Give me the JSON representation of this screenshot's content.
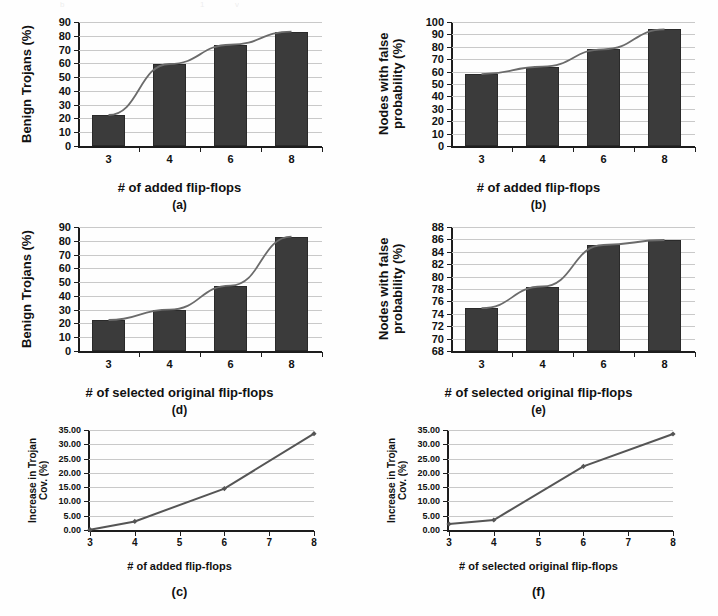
{
  "figure": {
    "background": "#ffffff",
    "bar_color": "#3b3b3b",
    "line_color": "#6b6b6b",
    "grid_color": "#c9c9c9",
    "axis_color": "#1d1d1d"
  },
  "panels": [
    {
      "caption": "(a)",
      "ylabel_lines": [
        "Benign Trojans (%)"
      ],
      "xlabel": "# of added flip-flops",
      "chart": {
        "type": "bar",
        "title": "",
        "xlabel": "# of added flip-flops",
        "ylabel": "Benign Trojans (%)",
        "categories": [
          "3",
          "4",
          "6",
          "8"
        ],
        "values": [
          22.5,
          59.5,
          73.5,
          83.0
        ],
        "yticks": [
          0,
          10,
          20,
          30,
          40,
          50,
          60,
          70,
          80,
          90
        ],
        "ylim": [
          0,
          90
        ],
        "grid": true,
        "trendline": true,
        "series": [
          {
            "name": "Benign Trojans",
            "values": [
              22.5,
              59.5,
              73.5,
              83.0
            ]
          }
        ]
      }
    },
    {
      "caption": "(b)",
      "ylabel_lines": [
        "Nodes with false",
        "probability (%)"
      ],
      "xlabel": "# of added flip-flops",
      "chart": {
        "type": "bar",
        "title": "",
        "xlabel": "# of added flip-flops",
        "ylabel": "Nodes with false probability (%)",
        "categories": [
          "3",
          "4",
          "6",
          "8"
        ],
        "values": [
          58.0,
          64.0,
          78.0,
          94.0
        ],
        "yticks": [
          0,
          10,
          20,
          30,
          40,
          50,
          60,
          70,
          80,
          90,
          100
        ],
        "ylim": [
          0,
          100
        ],
        "grid": true,
        "trendline": true,
        "series": [
          {
            "name": "Nodes with false probability",
            "values": [
              58.0,
              64.0,
              78.0,
              94.0
            ]
          }
        ]
      }
    },
    {
      "caption": "(d)",
      "ylabel_lines": [
        "Benign Trojans (%)"
      ],
      "xlabel": "# of selected original flip-flops",
      "chart": {
        "type": "bar",
        "title": "",
        "xlabel": "# of selected original flip-flops",
        "ylabel": "Benign Trojans (%)",
        "categories": [
          "3",
          "4",
          "6",
          "8"
        ],
        "values": [
          22.5,
          30.0,
          47.5,
          83.0
        ],
        "yticks": [
          0,
          10,
          20,
          30,
          40,
          50,
          60,
          70,
          80,
          90
        ],
        "ylim": [
          0,
          90
        ],
        "grid": true,
        "trendline": true,
        "series": [
          {
            "name": "Benign Trojans",
            "values": [
              22.5,
              30.0,
              47.5,
              83.0
            ]
          }
        ]
      }
    },
    {
      "caption": "(e)",
      "ylabel_lines": [
        "Nodes with false",
        "probability (%)"
      ],
      "xlabel": "# of selected original flip-flops",
      "chart": {
        "type": "bar",
        "title": "",
        "xlabel": "# of selected original flip-flops",
        "ylabel": "Nodes with false probability (%)",
        "categories": [
          "3",
          "4",
          "6",
          "8"
        ],
        "values": [
          74.9,
          78.4,
          85.1,
          85.9
        ],
        "yticks": [
          68,
          70,
          72,
          74,
          76,
          78,
          80,
          82,
          84,
          86,
          88
        ],
        "ylim": [
          68,
          88
        ],
        "grid": true,
        "trendline": true,
        "series": [
          {
            "name": "Nodes with false probability",
            "values": [
              74.9,
              78.4,
              85.1,
              85.9
            ]
          }
        ]
      }
    },
    {
      "caption": "(c)",
      "ylabel_lines": [
        "Increase in Trojan",
        "Cov. (%)"
      ],
      "xlabel": "# of added flip-flops",
      "chart": {
        "type": "line",
        "title": "",
        "xlabel": "# of added flip-flops",
        "ylabel": "Increase in Trojan Cov. (%)",
        "x": [
          3,
          4,
          6,
          8
        ],
        "values": [
          0.1,
          3.0,
          14.5,
          33.7
        ],
        "xticks": [
          3,
          4,
          5,
          6,
          7,
          8
        ],
        "xticklabels": [
          "3",
          "4",
          "5",
          "6",
          "7",
          "8"
        ],
        "yticks": [
          0,
          5,
          10,
          15,
          20,
          25,
          30,
          35
        ],
        "yticklabels": [
          "0.00",
          "5.00",
          "10.00",
          "15.00",
          "20.00",
          "25.00",
          "30.00",
          "35.00"
        ],
        "xlim": [
          3,
          8
        ],
        "ylim": [
          0,
          35
        ],
        "grid": true,
        "markers": true,
        "series": [
          {
            "name": "Increase in Trojan Cov.",
            "values": [
              0.1,
              3.0,
              14.5,
              33.7
            ]
          }
        ]
      }
    },
    {
      "caption": "(f)",
      "ylabel_lines": [
        "Increase in Trojan",
        "Cov. (%)"
      ],
      "xlabel": "# of selected original flip-flops",
      "chart": {
        "type": "line",
        "title": "",
        "xlabel": "# of selected original flip-flops",
        "ylabel": "Increase in Trojan Cov. (%)",
        "x": [
          3,
          4,
          6,
          8
        ],
        "values": [
          2.1,
          3.5,
          22.3,
          33.6
        ],
        "xticks": [
          3,
          4,
          5,
          6,
          7,
          8
        ],
        "xticklabels": [
          "3",
          "4",
          "5",
          "6",
          "7",
          "8"
        ],
        "yticks": [
          0,
          5,
          10,
          15,
          20,
          25,
          30,
          35
        ],
        "yticklabels": [
          "0.00",
          "5.00",
          "10.00",
          "15.00",
          "20.00",
          "25.00",
          "30.00",
          "35.00"
        ],
        "xlim": [
          3,
          8
        ],
        "ylim": [
          0,
          35
        ],
        "grid": true,
        "markers": true,
        "series": [
          {
            "name": "Increase in Trojan Cov.",
            "values": [
              2.1,
              3.5,
              22.3,
              33.6
            ]
          }
        ]
      }
    }
  ],
  "chart_data": [
    {
      "type": "bar",
      "panel": "(a)",
      "categories": [
        "3",
        "4",
        "6",
        "8"
      ],
      "values": [
        22.5,
        59.5,
        73.5,
        83.0
      ],
      "title": "",
      "xlabel": "# of added flip-flops",
      "ylabel": "Benign Trojans (%)",
      "ylim": [
        0,
        90
      ],
      "grid": true
    },
    {
      "type": "bar",
      "panel": "(b)",
      "categories": [
        "3",
        "4",
        "6",
        "8"
      ],
      "values": [
        58.0,
        64.0,
        78.0,
        94.0
      ],
      "title": "",
      "xlabel": "# of added flip-flops",
      "ylabel": "Nodes with false probability (%)",
      "ylim": [
        0,
        100
      ],
      "grid": true
    },
    {
      "type": "line",
      "panel": "(c)",
      "x": [
        3,
        4,
        6,
        8
      ],
      "values": [
        0.1,
        3.0,
        14.5,
        33.7
      ],
      "title": "",
      "xlabel": "# of added flip-flops",
      "ylabel": "Increase in Trojan Cov. (%)",
      "xlim": [
        3,
        8
      ],
      "ylim": [
        0,
        35
      ],
      "grid": true
    },
    {
      "type": "bar",
      "panel": "(d)",
      "categories": [
        "3",
        "4",
        "6",
        "8"
      ],
      "values": [
        22.5,
        30.0,
        47.5,
        83.0
      ],
      "title": "",
      "xlabel": "# of selected original flip-flops",
      "ylabel": "Benign Trojans (%)",
      "ylim": [
        0,
        90
      ],
      "grid": true
    },
    {
      "type": "bar",
      "panel": "(e)",
      "categories": [
        "3",
        "4",
        "6",
        "8"
      ],
      "values": [
        74.9,
        78.4,
        85.1,
        85.9
      ],
      "title": "",
      "xlabel": "# of selected original flip-flops",
      "ylabel": "Nodes with false probability (%)",
      "ylim": [
        68,
        88
      ],
      "grid": true
    },
    {
      "type": "line",
      "panel": "(f)",
      "x": [
        3,
        4,
        6,
        8
      ],
      "values": [
        2.1,
        3.5,
        22.3,
        33.6
      ],
      "title": "",
      "xlabel": "# of selected original flip-flops",
      "ylabel": "Increase in Trojan Cov. (%)",
      "xlim": [
        3,
        8
      ],
      "ylim": [
        0,
        35
      ],
      "grid": true
    }
  ]
}
